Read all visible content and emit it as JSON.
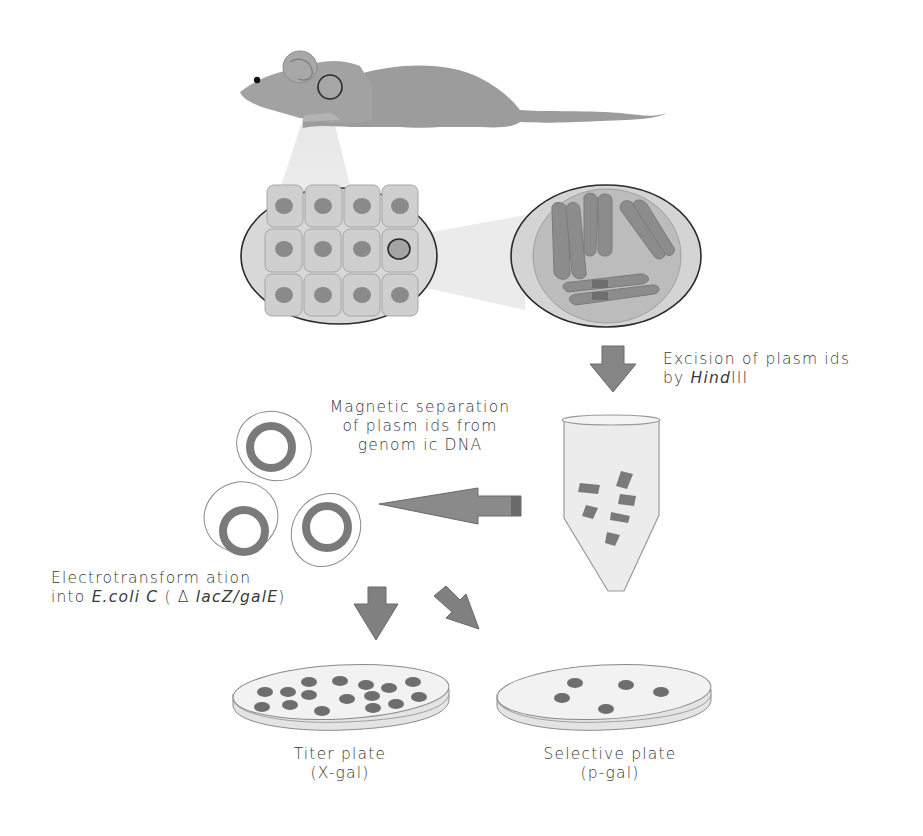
{
  "diagram": {
    "type": "workflow",
    "steps": [
      {
        "id": "mouse",
        "label": "Mouse tissue (sampled region)"
      },
      {
        "id": "cells",
        "label": "Tissue cells (one selected nucleus)"
      },
      {
        "id": "chromosomes",
        "label": "Nucleus chromosomes"
      },
      {
        "id": "excision",
        "label": "Excision of plasmids by HindIII"
      },
      {
        "id": "tube",
        "label": "Digested DNA in tube"
      },
      {
        "id": "separation",
        "label": "Magnetic separation of plasmids from genomic DNA"
      },
      {
        "id": "plasmids",
        "label": "Recovered plasmids"
      },
      {
        "id": "transformation",
        "label": "Electrotransformation into E.coli C (Δ lacZ/galE)"
      },
      {
        "id": "titer",
        "label": "Titer plate (X-gal)"
      },
      {
        "id": "selective",
        "label": "Selective plate (p-gal)"
      }
    ]
  },
  "labels": {
    "excision": {
      "line1": "Excision of plasm ids",
      "line2_prefix": "by ",
      "line2_italic": "Hind",
      "line2_suffix": "III"
    },
    "separation": {
      "line1": "Magnetic separation",
      "line2": "of plasm ids from",
      "line3": "genom ic DNA"
    },
    "transformation": {
      "line1": "Electrotransform ation",
      "line2_prefix": "into ",
      "line2_italic": "E.coli C",
      "line2_mid": " ( Δ ",
      "line2_italic2": "lacZ/galE",
      "line2_suffix": ")"
    },
    "titer": {
      "line1": "Titer plate",
      "line2": "(X-gal)"
    },
    "selective": {
      "line1": "Selective plate",
      "line2": "(p-gal)"
    }
  },
  "colors": {
    "body_gray": "#9a9a9a",
    "light_fill": "#dcdcdc",
    "dark_gray": "#6e6e6e",
    "outline": "#2a2a2a",
    "arrow": "#7a7a7a",
    "text": "#3a3a3a"
  }
}
